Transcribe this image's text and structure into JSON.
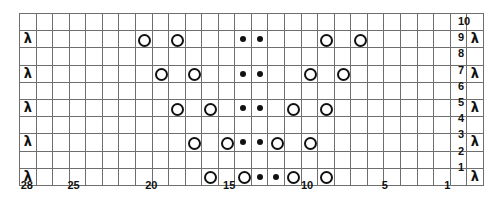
{
  "chart_data": {
    "type": "table",
    "grid": {
      "columns": 28,
      "rows": 10
    },
    "symbol_legend": {
      "yo": "yarn-over-open-circle",
      "purl": "purl-filled-dot",
      "dec": "decrease-lambda",
      "blank": "knit-empty-cell"
    },
    "column_labels": [
      {
        "number": "28",
        "column": 28
      },
      {
        "number": "25",
        "column": 25
      },
      {
        "number": "20",
        "column": 20
      },
      {
        "number": "15",
        "column": 15
      },
      {
        "number": "10",
        "column": 10
      },
      {
        "number": "5",
        "column": 5
      },
      {
        "number": "1",
        "column": 1
      }
    ],
    "row_labels": [
      "10",
      "9",
      "8",
      "7",
      "6",
      "5",
      "4",
      "3",
      "2",
      "1"
    ],
    "rows": [
      {
        "number": "10",
        "cells": [
          "blank",
          "blank",
          "blank",
          "blank",
          "blank",
          "blank",
          "blank",
          "blank",
          "blank",
          "blank",
          "blank",
          "blank",
          "blank",
          "blank",
          "blank",
          "blank",
          "blank",
          "blank",
          "blank",
          "blank",
          "blank",
          "blank",
          "blank",
          "blank",
          "blank",
          "blank",
          "blank",
          "blank"
        ]
      },
      {
        "number": "9",
        "cells": [
          "dec",
          "blank",
          "blank",
          "blank",
          "blank",
          "blank",
          "blank",
          "yo",
          "blank",
          "yo",
          "blank",
          "blank",
          "blank",
          "purl",
          "purl",
          "blank",
          "blank",
          "blank",
          "yo",
          "blank",
          "yo",
          "blank",
          "blank",
          "blank",
          "blank",
          "blank",
          "blank",
          "dec"
        ]
      },
      {
        "number": "8",
        "cells": [
          "blank",
          "blank",
          "blank",
          "blank",
          "blank",
          "blank",
          "blank",
          "blank",
          "blank",
          "blank",
          "blank",
          "blank",
          "blank",
          "blank",
          "blank",
          "blank",
          "blank",
          "blank",
          "blank",
          "blank",
          "blank",
          "blank",
          "blank",
          "blank",
          "blank",
          "blank",
          "blank",
          "blank"
        ]
      },
      {
        "number": "7",
        "cells": [
          "dec",
          "blank",
          "blank",
          "blank",
          "blank",
          "blank",
          "blank",
          "blank",
          "yo",
          "blank",
          "yo",
          "blank",
          "blank",
          "purl",
          "purl",
          "blank",
          "blank",
          "yo",
          "blank",
          "yo",
          "blank",
          "blank",
          "blank",
          "blank",
          "blank",
          "blank",
          "blank",
          "dec"
        ]
      },
      {
        "number": "6",
        "cells": [
          "blank",
          "blank",
          "blank",
          "blank",
          "blank",
          "blank",
          "blank",
          "blank",
          "blank",
          "blank",
          "blank",
          "blank",
          "blank",
          "blank",
          "blank",
          "blank",
          "blank",
          "blank",
          "blank",
          "blank",
          "blank",
          "blank",
          "blank",
          "blank",
          "blank",
          "blank",
          "blank",
          "blank"
        ]
      },
      {
        "number": "5",
        "cells": [
          "dec",
          "blank",
          "blank",
          "blank",
          "blank",
          "blank",
          "blank",
          "blank",
          "blank",
          "yo",
          "blank",
          "yo",
          "blank",
          "purl",
          "purl",
          "blank",
          "yo",
          "blank",
          "yo",
          "blank",
          "blank",
          "blank",
          "blank",
          "blank",
          "blank",
          "blank",
          "blank",
          "dec"
        ]
      },
      {
        "number": "4",
        "cells": [
          "blank",
          "blank",
          "blank",
          "blank",
          "blank",
          "blank",
          "blank",
          "blank",
          "blank",
          "blank",
          "blank",
          "blank",
          "blank",
          "blank",
          "blank",
          "blank",
          "blank",
          "blank",
          "blank",
          "blank",
          "blank",
          "blank",
          "blank",
          "blank",
          "blank",
          "blank",
          "blank",
          "blank"
        ]
      },
      {
        "number": "3",
        "cells": [
          "dec",
          "blank",
          "blank",
          "blank",
          "blank",
          "blank",
          "blank",
          "blank",
          "blank",
          "blank",
          "yo",
          "blank",
          "yo",
          "purl",
          "purl",
          "yo",
          "blank",
          "yo",
          "blank",
          "blank",
          "blank",
          "blank",
          "blank",
          "blank",
          "blank",
          "blank",
          "blank",
          "dec"
        ]
      },
      {
        "number": "2",
        "cells": [
          "blank",
          "blank",
          "blank",
          "blank",
          "blank",
          "blank",
          "blank",
          "blank",
          "blank",
          "blank",
          "blank",
          "blank",
          "blank",
          "blank",
          "blank",
          "blank",
          "blank",
          "blank",
          "blank",
          "blank",
          "blank",
          "blank",
          "blank",
          "blank",
          "blank",
          "blank",
          "blank",
          "blank"
        ]
      },
      {
        "number": "1",
        "cells": [
          "dec",
          "blank",
          "blank",
          "blank",
          "blank",
          "blank",
          "blank",
          "blank",
          "blank",
          "blank",
          "blank",
          "yo",
          "blank",
          "yo",
          "purl",
          "purl",
          "yo",
          "blank",
          "yo",
          "blank",
          "blank",
          "blank",
          "blank",
          "blank",
          "blank",
          "blank",
          "blank",
          "dec"
        ]
      }
    ]
  },
  "symbols": {
    "decrease_glyph": "λ"
  }
}
